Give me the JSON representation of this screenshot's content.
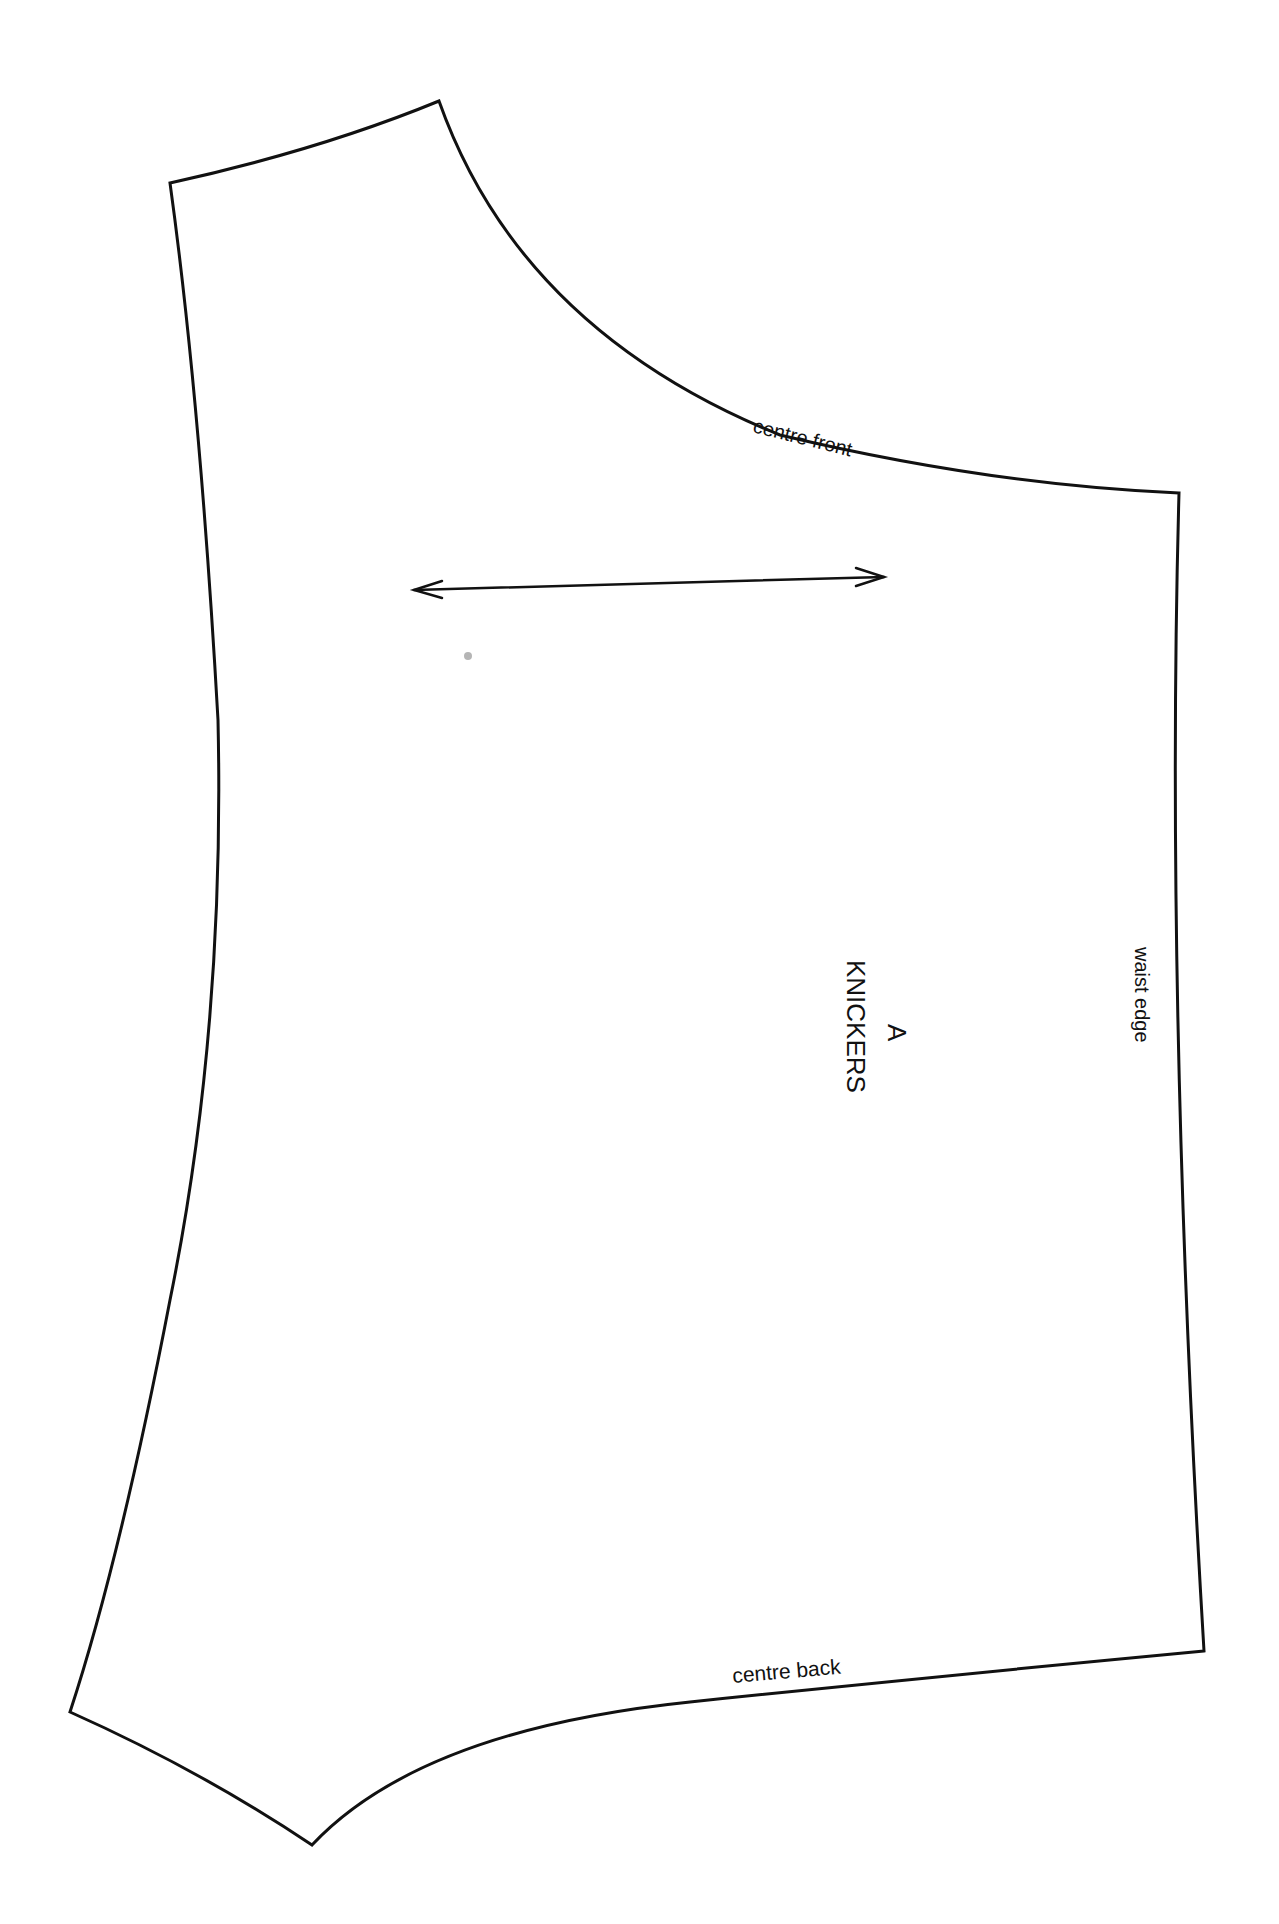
{
  "pattern_piece": {
    "piece_letter": "A",
    "piece_name": "KNICKERS",
    "edge_labels": {
      "centre_front": "centre front",
      "centre_back": "centre back",
      "waist_edge": "waist edge"
    },
    "grainline_icon": "double-headed-arrow",
    "colors": {
      "line": "#111111",
      "paper": "#ffffff",
      "speck": "#b5b5b5"
    }
  }
}
